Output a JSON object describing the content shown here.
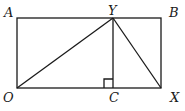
{
  "diagram": {
    "type": "geometry",
    "points": {
      "A": {
        "label": "A",
        "x": 17,
        "y": 18
      },
      "B": {
        "label": "B",
        "x": 161,
        "y": 18
      },
      "O": {
        "label": "O",
        "x": 17,
        "y": 88
      },
      "X": {
        "label": "X",
        "x": 161,
        "y": 88
      },
      "Y": {
        "label": "Y",
        "x": 113,
        "y": 18
      },
      "C": {
        "label": "C",
        "x": 113,
        "y": 88
      }
    },
    "labels": {
      "A": "A",
      "B": "B",
      "O": "O",
      "X": "X",
      "Y": "Y",
      "C": "C"
    },
    "segments": [
      [
        "O",
        "X"
      ],
      [
        "X",
        "B"
      ],
      [
        "B",
        "A"
      ],
      [
        "A",
        "O"
      ],
      [
        "O",
        "Y"
      ],
      [
        "Y",
        "X"
      ],
      [
        "Y",
        "C"
      ]
    ],
    "right_angle_at": "C",
    "stroke_color": "#1a1a1a"
  }
}
